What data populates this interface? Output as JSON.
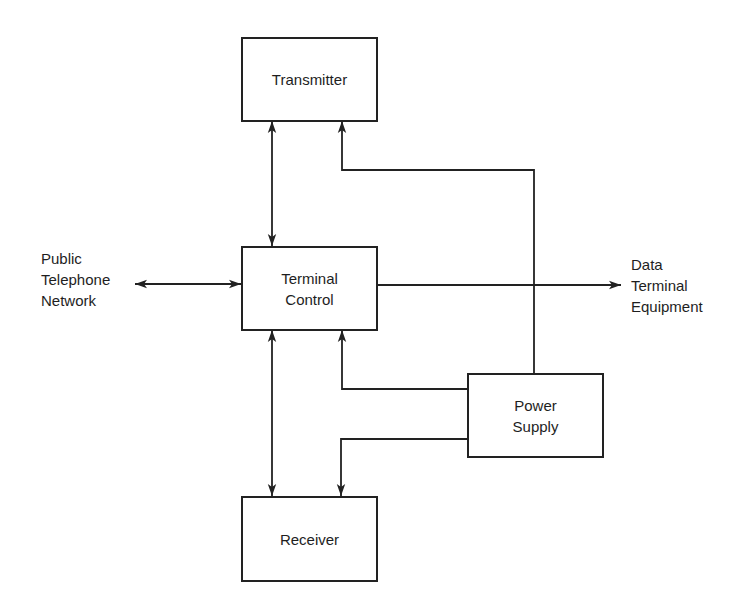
{
  "diagram": {
    "type": "block-diagram",
    "blocks": {
      "transmitter": {
        "label": "Transmitter"
      },
      "terminal_control": {
        "label": "Terminal\nControl"
      },
      "receiver": {
        "label": "Receiver"
      },
      "power_supply": {
        "label": "Power\nSupply"
      }
    },
    "external": {
      "left": {
        "label": "Public\nTelephone\nNetwork"
      },
      "right": {
        "label": "Data\nTerminal\nEquipment"
      }
    },
    "connections": [
      {
        "from": "Transmitter",
        "to": "Terminal Control",
        "direction": "bidirectional"
      },
      {
        "from": "Terminal Control",
        "to": "Receiver",
        "direction": "bidirectional"
      },
      {
        "from": "Public Telephone Network",
        "to": "Terminal Control",
        "direction": "bidirectional"
      },
      {
        "from": "Terminal Control",
        "to": "Data Terminal Equipment",
        "direction": "one-way"
      },
      {
        "from": "Power Supply",
        "to": "Transmitter",
        "direction": "one-way"
      },
      {
        "from": "Power Supply",
        "to": "Terminal Control",
        "direction": "one-way"
      },
      {
        "from": "Power Supply",
        "to": "Receiver",
        "direction": "one-way"
      }
    ],
    "colors": {
      "line": "#222222",
      "background": "#ffffff"
    }
  }
}
